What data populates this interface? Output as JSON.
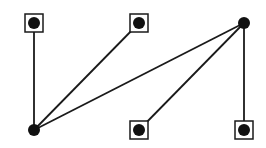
{
  "diagram": {
    "type": "bipartite-graph",
    "width": 266,
    "height": 148,
    "colors": {
      "stroke": "#1a1a1a",
      "node_fill": "#111111",
      "background": "#ffffff"
    },
    "node_radius": 6,
    "box_size": 18,
    "nodes": [
      {
        "id": "A",
        "x": 34,
        "y": 23,
        "boxed": true
      },
      {
        "id": "B",
        "x": 139,
        "y": 23,
        "boxed": true
      },
      {
        "id": "C",
        "x": 244,
        "y": 23,
        "boxed": false
      },
      {
        "id": "D",
        "x": 34,
        "y": 130,
        "boxed": false
      },
      {
        "id": "E",
        "x": 139,
        "y": 130,
        "boxed": true
      },
      {
        "id": "F",
        "x": 244,
        "y": 130,
        "boxed": true
      }
    ],
    "edges": [
      {
        "from": "A",
        "to": "D"
      },
      {
        "from": "B",
        "to": "D"
      },
      {
        "from": "C",
        "to": "D"
      },
      {
        "from": "C",
        "to": "E"
      },
      {
        "from": "C",
        "to": "F"
      }
    ]
  }
}
